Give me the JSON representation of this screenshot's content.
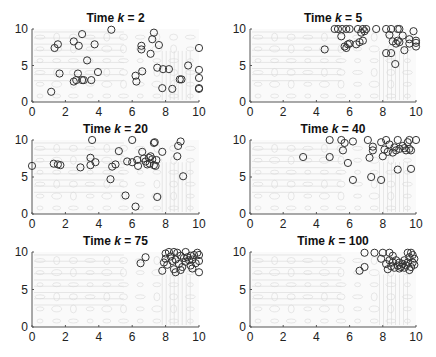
{
  "figure": {
    "layout": {
      "rows": 3,
      "cols": 2
    },
    "colors": {
      "marker": "#333333",
      "axis": "#555555",
      "contour": "#d9d9d9",
      "background": "#ffffff"
    }
  },
  "chart_data": [
    {
      "type": "scatter",
      "title": "Time k = 2",
      "title_prefix": "Time ",
      "title_var": "k",
      "title_suffix": " = 2",
      "xlim": [
        0,
        10
      ],
      "ylim": [
        0,
        10
      ],
      "xticks": [
        "0",
        "2",
        "4",
        "6",
        "8",
        "10"
      ],
      "yticks": [
        "0",
        "5",
        "10"
      ],
      "marker": "circle-open",
      "background": "contour",
      "points": [
        [
          1.35,
          7.4
        ],
        [
          1.55,
          7.9
        ],
        [
          1.15,
          1.4
        ],
        [
          1.65,
          3.9
        ],
        [
          2.5,
          8.3
        ],
        [
          3.0,
          9.3
        ],
        [
          2.8,
          7.7
        ],
        [
          3.3,
          5.7
        ],
        [
          3.75,
          7.9
        ],
        [
          2.75,
          3.9
        ],
        [
          2.5,
          2.8
        ],
        [
          2.65,
          3.0
        ],
        [
          3.0,
          3.0
        ],
        [
          3.1,
          3.0
        ],
        [
          3.55,
          3.0
        ],
        [
          3.95,
          4.1
        ],
        [
          4.75,
          9.9
        ],
        [
          6.55,
          7.2
        ],
        [
          6.55,
          7.7
        ],
        [
          6.6,
          4.2
        ],
        [
          6.2,
          3.6
        ],
        [
          6.25,
          2.8
        ],
        [
          7.1,
          6.6
        ],
        [
          7.2,
          8.6
        ],
        [
          7.3,
          9.5
        ],
        [
          7.6,
          7.8
        ],
        [
          7.5,
          4.7
        ],
        [
          7.85,
          4.5
        ],
        [
          8.2,
          4.5
        ],
        [
          7.8,
          1.9
        ],
        [
          8.4,
          1.8
        ],
        [
          8.85,
          3.1
        ],
        [
          8.95,
          3.1
        ],
        [
          9.35,
          5.0
        ],
        [
          10.0,
          7.4
        ],
        [
          10.0,
          4.4
        ],
        [
          10.0,
          3.3
        ],
        [
          10.0,
          1.9
        ],
        [
          10.0,
          1.8
        ]
      ]
    },
    {
      "type": "scatter",
      "title": "Time k = 5",
      "title_prefix": "Time ",
      "title_var": "k",
      "title_suffix": " = 5",
      "xlim": [
        0,
        10
      ],
      "ylim": [
        0,
        10
      ],
      "xticks": [
        "0",
        "2",
        "4",
        "6",
        "8",
        "10"
      ],
      "yticks": [
        "0",
        "5",
        "10"
      ],
      "marker": "circle-open",
      "background": "contour",
      "points": [
        [
          4.5,
          7.2
        ],
        [
          5.1,
          10.0
        ],
        [
          5.3,
          10.0
        ],
        [
          5.55,
          10.0
        ],
        [
          5.5,
          9.0
        ],
        [
          5.8,
          10.0
        ],
        [
          6.0,
          10.0
        ],
        [
          6.5,
          10.0
        ],
        [
          6.8,
          10.0
        ],
        [
          7.0,
          10.0
        ],
        [
          7.6,
          10.0
        ],
        [
          5.7,
          7.6
        ],
        [
          5.8,
          7.4
        ],
        [
          5.9,
          7.9
        ],
        [
          6.0,
          8.0
        ],
        [
          6.4,
          7.9
        ],
        [
          6.6,
          8.2
        ],
        [
          6.8,
          8.4
        ],
        [
          6.7,
          9.5
        ],
        [
          6.9,
          9.7
        ],
        [
          8.2,
          10.0
        ],
        [
          8.5,
          10.0
        ],
        [
          8.9,
          10.0
        ],
        [
          9.0,
          10.0
        ],
        [
          8.4,
          9.2
        ],
        [
          8.6,
          8.3
        ],
        [
          8.8,
          8.0
        ],
        [
          8.9,
          8.4
        ],
        [
          9.0,
          8.2
        ],
        [
          9.2,
          9.1
        ],
        [
          9.3,
          7.1
        ],
        [
          9.6,
          8.6
        ],
        [
          9.6,
          8.0
        ],
        [
          9.85,
          9.7
        ],
        [
          10.0,
          8.4
        ],
        [
          10.0,
          8.1
        ],
        [
          10.0,
          7.6
        ],
        [
          8.2,
          6.7
        ],
        [
          8.5,
          6.7
        ],
        [
          8.75,
          5.2
        ]
      ]
    },
    {
      "type": "scatter",
      "title": "Time k = 20",
      "title_prefix": "Time ",
      "title_var": "k",
      "title_suffix": " = 20",
      "xlim": [
        0,
        10
      ],
      "ylim": [
        0,
        10
      ],
      "xticks": [
        "0",
        "2",
        "4",
        "6",
        "8",
        "10"
      ],
      "yticks": [
        "0",
        "5",
        "10"
      ],
      "marker": "circle-open",
      "background": "contour",
      "points": [
        [
          0.0,
          6.5
        ],
        [
          1.3,
          6.8
        ],
        [
          1.55,
          6.7
        ],
        [
          1.7,
          6.6
        ],
        [
          2.9,
          6.3
        ],
        [
          3.5,
          7.6
        ],
        [
          3.5,
          6.6
        ],
        [
          3.8,
          7.0
        ],
        [
          3.6,
          10.0
        ],
        [
          4.7,
          4.7
        ],
        [
          4.8,
          6.4
        ],
        [
          5.0,
          6.7
        ],
        [
          5.2,
          8.5
        ],
        [
          5.6,
          2.5
        ],
        [
          5.7,
          7.1
        ],
        [
          6.0,
          10.0
        ],
        [
          6.0,
          7.0
        ],
        [
          6.2,
          1.0
        ],
        [
          6.3,
          7.3
        ],
        [
          6.35,
          6.5
        ],
        [
          6.6,
          8.4
        ],
        [
          6.7,
          7.5
        ],
        [
          6.8,
          7.1
        ],
        [
          6.9,
          6.7
        ],
        [
          7.0,
          7.6
        ],
        [
          7.05,
          6.8
        ],
        [
          7.1,
          7.8
        ],
        [
          7.2,
          7.4
        ],
        [
          7.3,
          6.6
        ],
        [
          7.3,
          9.6
        ],
        [
          7.35,
          9.7
        ],
        [
          7.45,
          7.3
        ],
        [
          7.4,
          6.5
        ],
        [
          7.5,
          2.3
        ],
        [
          7.8,
          8.4
        ],
        [
          8.7,
          7.8
        ],
        [
          8.75,
          9.2
        ],
        [
          8.9,
          9.8
        ],
        [
          9.05,
          5.1
        ]
      ]
    },
    {
      "type": "scatter",
      "title": "Time k = 40",
      "title_prefix": "Time ",
      "title_var": "k",
      "title_suffix": " = 40",
      "xlim": [
        0,
        10
      ],
      "ylim": [
        0,
        10
      ],
      "xticks": [
        "0",
        "2",
        "4",
        "6",
        "8",
        "10"
      ],
      "yticks": [
        "0",
        "5",
        "10"
      ],
      "marker": "circle-open",
      "background": "contour",
      "points": [
        [
          3.2,
          7.7
        ],
        [
          4.8,
          10.0
        ],
        [
          4.8,
          7.7
        ],
        [
          5.5,
          10.0
        ],
        [
          5.6,
          8.6
        ],
        [
          5.7,
          9.6
        ],
        [
          5.9,
          6.9
        ],
        [
          6.2,
          9.8
        ],
        [
          6.2,
          4.6
        ],
        [
          7.1,
          10.0
        ],
        [
          7.2,
          7.6
        ],
        [
          7.4,
          9.1
        ],
        [
          7.4,
          8.6
        ],
        [
          7.3,
          5.0
        ],
        [
          7.9,
          4.6
        ],
        [
          7.9,
          9.7
        ],
        [
          8.0,
          7.8
        ],
        [
          8.1,
          8.7
        ],
        [
          8.2,
          10.0
        ],
        [
          8.3,
          8.4
        ],
        [
          8.4,
          9.4
        ],
        [
          8.6,
          8.3
        ],
        [
          8.7,
          9.0
        ],
        [
          8.8,
          8.6
        ],
        [
          8.9,
          10.0
        ],
        [
          8.9,
          6.0
        ],
        [
          9.0,
          8.8
        ],
        [
          9.2,
          9.2
        ],
        [
          9.3,
          8.9
        ],
        [
          9.4,
          8.6
        ],
        [
          9.5,
          9.7
        ],
        [
          9.6,
          8.8
        ],
        [
          9.6,
          10.0
        ],
        [
          9.7,
          8.6
        ],
        [
          9.7,
          6.1
        ],
        [
          10.0,
          10.0
        ]
      ]
    },
    {
      "type": "scatter",
      "title": "Time k = 75",
      "title_prefix": "Time ",
      "title_var": "k",
      "title_suffix": " = 75",
      "xlim": [
        0,
        10
      ],
      "ylim": [
        0,
        10
      ],
      "xticks": [
        "0",
        "2",
        "4",
        "6",
        "8",
        "10"
      ],
      "yticks": [
        "0",
        "5",
        "10"
      ],
      "marker": "circle-open",
      "background": "contour",
      "points": [
        [
          6.5,
          8.5
        ],
        [
          6.8,
          9.3
        ],
        [
          7.8,
          7.5
        ],
        [
          7.9,
          8.6
        ],
        [
          8.0,
          9.8
        ],
        [
          8.0,
          9.1
        ],
        [
          8.1,
          8.3
        ],
        [
          8.2,
          10.0
        ],
        [
          8.3,
          9.4
        ],
        [
          8.4,
          8.8
        ],
        [
          8.5,
          10.0
        ],
        [
          8.5,
          7.7
        ],
        [
          8.6,
          7.3
        ],
        [
          8.6,
          9.0
        ],
        [
          8.7,
          9.9
        ],
        [
          8.8,
          8.4
        ],
        [
          8.9,
          7.6
        ],
        [
          8.9,
          9.5
        ],
        [
          9.0,
          8.0
        ],
        [
          9.1,
          9.2
        ],
        [
          9.2,
          8.7
        ],
        [
          9.2,
          10.0
        ],
        [
          9.3,
          9.3
        ],
        [
          9.4,
          8.9
        ],
        [
          9.5,
          9.5
        ],
        [
          9.5,
          8.2
        ],
        [
          9.6,
          7.8
        ],
        [
          9.6,
          9.0
        ],
        [
          9.7,
          9.6
        ],
        [
          9.8,
          8.5
        ],
        [
          9.9,
          9.9
        ],
        [
          10.0,
          9.6
        ],
        [
          10.0,
          8.8
        ],
        [
          10.0,
          7.3
        ]
      ]
    },
    {
      "type": "scatter",
      "title": "Time k = 100",
      "title_prefix": "Time ",
      "title_var": "k",
      "title_suffix": " = 100",
      "xlim": [
        0,
        10
      ],
      "ylim": [
        0,
        10
      ],
      "xticks": [
        "0",
        "2",
        "4",
        "6",
        "8",
        "10"
      ],
      "yticks": [
        "0",
        "5",
        "10"
      ],
      "marker": "circle-open",
      "background": "contour",
      "points": [
        [
          6.6,
          7.5
        ],
        [
          6.9,
          8.0
        ],
        [
          6.9,
          9.9
        ],
        [
          7.5,
          9.9
        ],
        [
          8.0,
          9.9
        ],
        [
          7.9,
          9.1
        ],
        [
          8.2,
          8.4
        ],
        [
          8.3,
          7.7
        ],
        [
          8.4,
          9.9
        ],
        [
          8.4,
          8.9
        ],
        [
          8.5,
          8.1
        ],
        [
          8.6,
          9.5
        ],
        [
          8.6,
          8.6
        ],
        [
          8.7,
          7.9
        ],
        [
          8.8,
          8.9
        ],
        [
          8.9,
          8.2
        ],
        [
          9.0,
          8.6
        ],
        [
          9.0,
          7.8
        ],
        [
          9.1,
          8.0
        ],
        [
          9.2,
          8.4
        ],
        [
          9.3,
          8.9
        ],
        [
          9.3,
          7.9
        ],
        [
          9.4,
          8.2
        ],
        [
          9.5,
          9.9
        ],
        [
          9.5,
          8.6
        ],
        [
          9.6,
          7.6
        ],
        [
          9.6,
          9.3
        ],
        [
          9.7,
          8.0
        ],
        [
          9.7,
          9.9
        ],
        [
          9.8,
          8.6
        ],
        [
          9.8,
          9.6
        ],
        [
          9.9,
          8.3
        ],
        [
          9.9,
          9.1
        ]
      ]
    }
  ]
}
